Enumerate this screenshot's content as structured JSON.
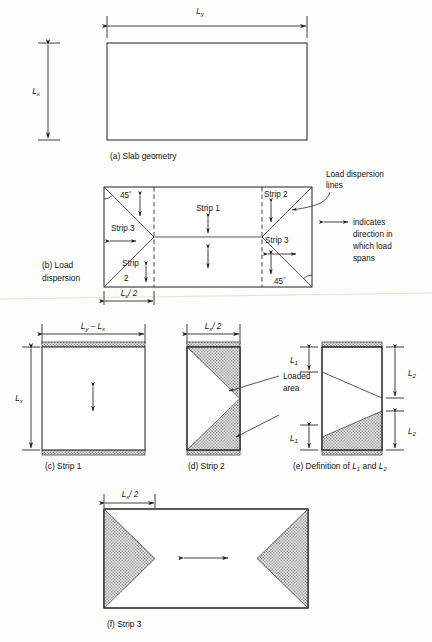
{
  "figure": {
    "title_note": "Slab load dispersion figure",
    "hatch_color": "#9a9a9a",
    "line_color": "#2b2b2b",
    "background": "#fdfdfb"
  },
  "panel_a": {
    "caption": "(a) Slab geometry",
    "dim_width": "L",
    "dim_width_sub": "y",
    "dim_height": "L",
    "dim_height_sub": "x"
  },
  "panel_b": {
    "caption_line1": "(b) Load",
    "caption_line2": "dispersion",
    "angle_top_left": "45",
    "angle_top_left_unit": "°",
    "angle_bottom_right": "45",
    "angle_bottom_right_unit": "°",
    "strip1": "Strip 1",
    "strip2_top": "Strip 2",
    "strip2_left_line1": "Strip",
    "strip2_left_line2": "2",
    "strip3_left": "Strip 3",
    "strip3_right": "Strip 3",
    "dim_base": "L",
    "dim_base_sub": "x",
    "dim_base_div": "/ 2",
    "note_dispersion_line1": "Load dispersion",
    "note_dispersion_line2": "lines",
    "note_direction_line1": "indicates",
    "note_direction_line2": "direction in",
    "note_direction_line3": "which load",
    "note_direction_line4": "spans"
  },
  "panel_c": {
    "caption": "(c) Strip 1",
    "dim_top_a": "L",
    "dim_top_a_sub": "y",
    "dim_top_minus": " – ",
    "dim_top_b": "L",
    "dim_top_b_sub": "x",
    "dim_left": "L",
    "dim_left_sub": "x"
  },
  "panel_d": {
    "caption": "(d) Strip 2",
    "dim_top": "L",
    "dim_top_sub": "x",
    "dim_top_div": "/ 2",
    "note_line1": "Loaded",
    "note_line2": "area"
  },
  "panel_e": {
    "caption_prefix": "(e) Definition of ",
    "caption_l1": "L",
    "caption_l1_sub": "1",
    "caption_and": " and ",
    "caption_l2": "L",
    "caption_l2_sub": "2",
    "dim_l1_top": "L",
    "dim_l1_top_sub": "1",
    "dim_l1_bottom": "L",
    "dim_l1_bottom_sub": "1",
    "dim_l2_top": "L",
    "dim_l2_top_sub": "2",
    "dim_l2_bottom": "L",
    "dim_l2_bottom_sub": "2"
  },
  "panel_f": {
    "caption": "(f) Strip 3",
    "dim_top": "L",
    "dim_top_sub": "x",
    "dim_top_div": "/ 2"
  }
}
